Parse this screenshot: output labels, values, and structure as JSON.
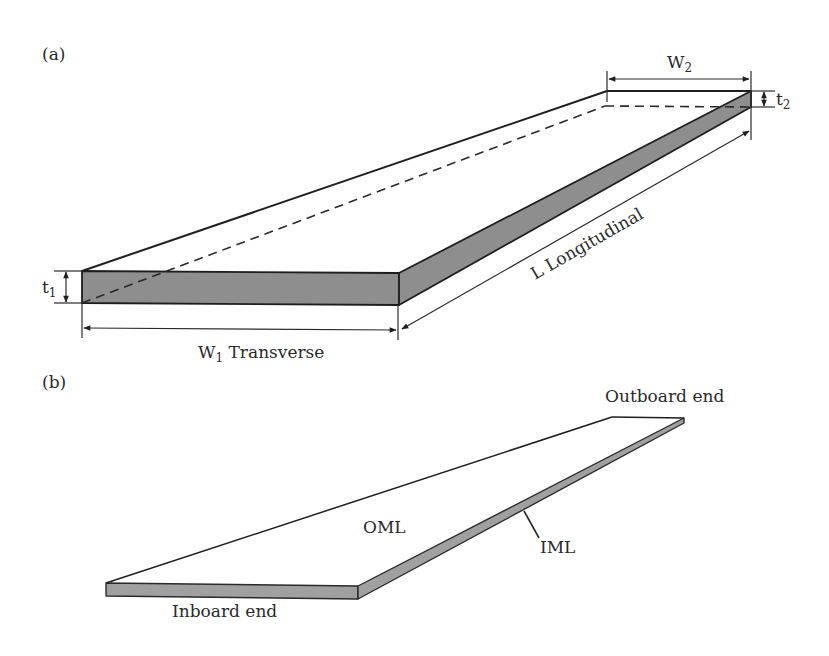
{
  "figure": {
    "panel_a": {
      "label": "(a)",
      "w2": {
        "main": "W",
        "sub": "2"
      },
      "t2": {
        "main": "t",
        "sub": "2"
      },
      "t1": {
        "main": "t",
        "sub": "1"
      },
      "w1": {
        "main": "W",
        "sub": "1",
        "suffix": " Transverse"
      },
      "length": "L  Longitudinal"
    },
    "panel_b": {
      "label": "(b)",
      "outboard": "Outboard end",
      "inboard": "Inboard end",
      "oml": "OML",
      "iml": "IML"
    },
    "colors": {
      "face_fill": "#8e8e8e",
      "line": "#1e1e1e"
    }
  }
}
